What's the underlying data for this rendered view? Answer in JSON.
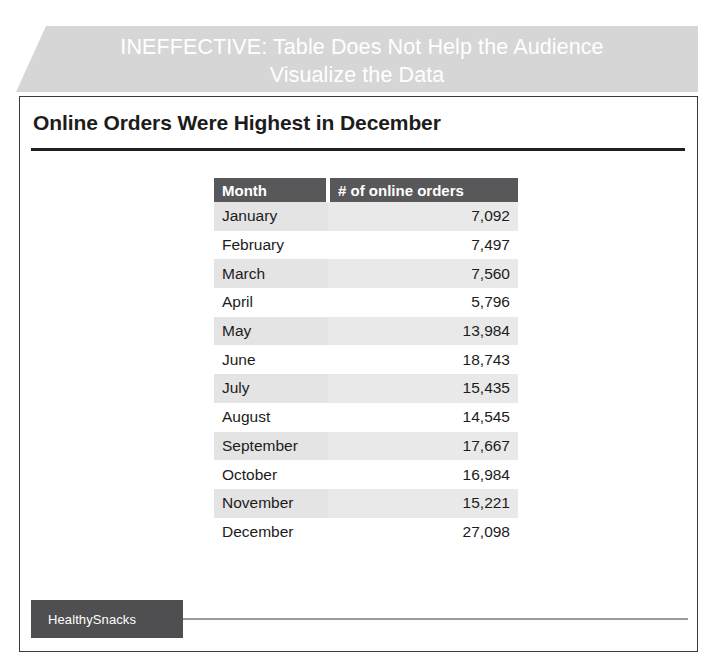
{
  "banner": {
    "line1": "INEFFECTIVE: Table Does Not Help the Audience",
    "line2": "Visualize the Data",
    "background_color": "#d6d6d6",
    "text_color": "#ffffff"
  },
  "slide": {
    "title": "Online Orders Were Highest in December",
    "border_color": "#3b3b3b",
    "rule_color": "#231f20"
  },
  "table": {
    "headers": [
      "Month",
      "# of online orders"
    ],
    "header_background": "#58585a",
    "header_text_color": "#ffffff",
    "band_color": "#e6e6e6",
    "rows": [
      {
        "month": "January",
        "orders": "7,092"
      },
      {
        "month": "February",
        "orders": "7,497"
      },
      {
        "month": "March",
        "orders": "7,560"
      },
      {
        "month": "April",
        "orders": "5,796"
      },
      {
        "month": "May",
        "orders": "13,984"
      },
      {
        "month": "June",
        "orders": "18,743"
      },
      {
        "month": "July",
        "orders": "15,435"
      },
      {
        "month": "August",
        "orders": "14,545"
      },
      {
        "month": "September",
        "orders": "17,667"
      },
      {
        "month": "October",
        "orders": "16,984"
      },
      {
        "month": "November",
        "orders": "15,221"
      },
      {
        "month": "December",
        "orders": "27,098"
      }
    ]
  },
  "footer": {
    "logo_text": "HealthySnacks",
    "logo_background": "#4f4f51",
    "logo_text_color": "#ffffff",
    "rule_color": "#9a9a9a"
  },
  "chart_data": {
    "type": "table",
    "title": "Online Orders Were Highest in December",
    "columns": [
      "Month",
      "# of online orders"
    ],
    "categories": [
      "January",
      "February",
      "March",
      "April",
      "May",
      "June",
      "July",
      "August",
      "September",
      "October",
      "November",
      "December"
    ],
    "values": [
      7092,
      7497,
      7560,
      5796,
      13984,
      18743,
      15435,
      14545,
      17667,
      16984,
      15221,
      27098
    ],
    "xlabel": "Month",
    "ylabel": "# of online orders"
  }
}
